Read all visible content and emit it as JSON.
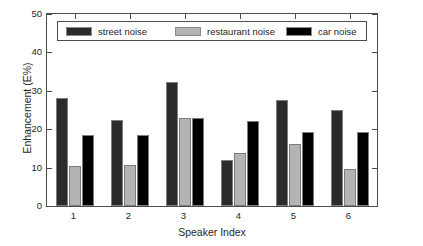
{
  "chart_data": {
    "type": "bar",
    "title": "",
    "xlabel": "Speaker Index",
    "ylabel": "Enhancement (E%)",
    "categories": [
      "1",
      "2",
      "3",
      "4",
      "5",
      "6"
    ],
    "series": [
      {
        "name": "street noise",
        "values": [
          28.2,
          22.3,
          32.3,
          11.9,
          27.7,
          25.0
        ],
        "color": "#2b2b2b"
      },
      {
        "name": "restaurant noise",
        "values": [
          10.5,
          10.8,
          22.9,
          13.8,
          16.2,
          9.7
        ],
        "color": "#b4b4b4"
      },
      {
        "name": "car noise",
        "values": [
          18.6,
          18.5,
          22.8,
          22.2,
          19.4,
          19.2
        ],
        "color": "#000000"
      }
    ],
    "ylim": [
      0,
      50
    ],
    "yticks": [
      0,
      10,
      20,
      30,
      40,
      50
    ],
    "ytick_labels": [
      "0",
      "10",
      "20",
      "30",
      "40",
      "50"
    ],
    "xtick_labels": [
      "1",
      "2",
      "3",
      "4",
      "5",
      "6"
    ],
    "grid": false,
    "legend_position": "top",
    "legend_entries": [
      "street noise",
      "restaurant noise",
      "car noise"
    ]
  }
}
